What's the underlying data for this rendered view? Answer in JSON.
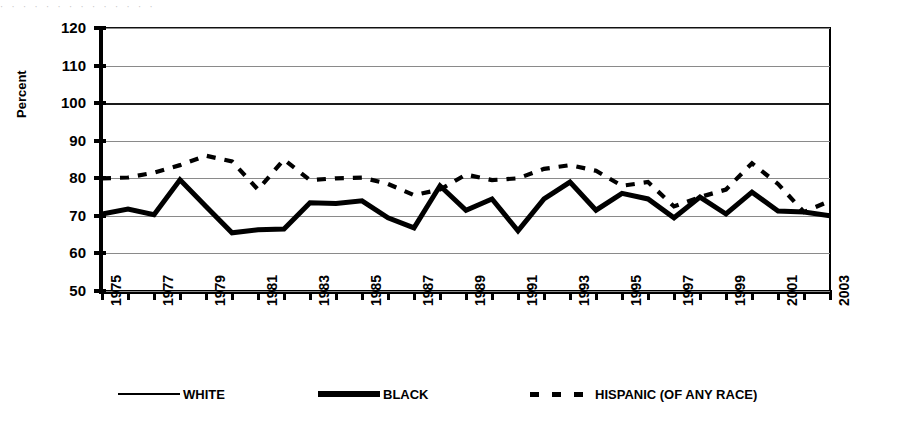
{
  "artifact_text": "·  ·   ·  ·   ·    ·   ·  ·   ·   ·  ·    ·   ·  ·",
  "axis": {
    "ylabel": "Percent",
    "yticks": [
      "120",
      "110",
      "100",
      "90",
      "80",
      "70",
      "60",
      "50"
    ],
    "xticks": [
      "1975",
      "1977",
      "1979",
      "1981",
      "1983",
      "1985",
      "1987",
      "1989",
      "1991",
      "1993",
      "1995",
      "1997",
      "1999",
      "2001",
      "2003"
    ]
  },
  "legend": {
    "items": [
      {
        "label": "WHITE",
        "style": "thin-solid",
        "color": "#000000"
      },
      {
        "label": "BLACK",
        "style": "thick-solid",
        "color": "#000000"
      },
      {
        "label": "HISPANIC (OF ANY RACE)",
        "style": "dashed",
        "color": "#000000"
      }
    ]
  },
  "chart_data": {
    "type": "line",
    "title": "",
    "xlabel": "",
    "ylabel": "Percent",
    "xlim": [
      1975,
      2003
    ],
    "ylim": [
      50,
      120
    ],
    "ytick_step": 10,
    "grid": true,
    "legend_position": "bottom",
    "x": [
      1975,
      1976,
      1977,
      1978,
      1979,
      1980,
      1981,
      1982,
      1983,
      1984,
      1985,
      1986,
      1987,
      1988,
      1989,
      1990,
      1991,
      1992,
      1993,
      1994,
      1995,
      1996,
      1997,
      1998,
      1999,
      2000,
      2001,
      2002,
      2003
    ],
    "series": [
      {
        "name": "WHITE",
        "style": "thin-solid",
        "values": [
          70.5,
          71.8,
          70.3,
          79.6,
          72.5,
          65.5,
          66.3,
          66.5,
          73.5,
          73.3,
          74.0,
          69.5,
          66.8,
          78.0,
          71.5,
          74.5,
          66.0,
          74.5,
          79.0,
          71.5,
          76.0,
          74.5,
          69.5,
          75.0,
          70.5,
          76.3,
          71.3,
          71.0,
          70.0
        ]
      },
      {
        "name": "BLACK",
        "style": "thick-solid",
        "values": [
          70.5,
          71.8,
          70.3,
          79.6,
          72.5,
          65.5,
          66.3,
          66.5,
          73.5,
          73.3,
          74.0,
          69.5,
          66.8,
          78.0,
          71.5,
          74.5,
          66.0,
          74.5,
          79.0,
          71.5,
          76.0,
          74.5,
          69.5,
          75.0,
          70.5,
          76.3,
          71.3,
          71.0,
          70.0
        ]
      },
      {
        "name": "HISPANIC (OF ANY RACE)",
        "style": "dashed",
        "values": [
          80.0,
          80.2,
          81.5,
          83.5,
          86.0,
          84.5,
          77.0,
          85.0,
          79.5,
          80.0,
          80.2,
          78.5,
          75.5,
          77.0,
          81.0,
          79.5,
          80.0,
          82.5,
          83.5,
          82.0,
          78.0,
          79.0,
          72.5,
          75.0,
          77.0,
          84.0,
          78.5,
          71.0,
          74.0
        ]
      }
    ]
  }
}
